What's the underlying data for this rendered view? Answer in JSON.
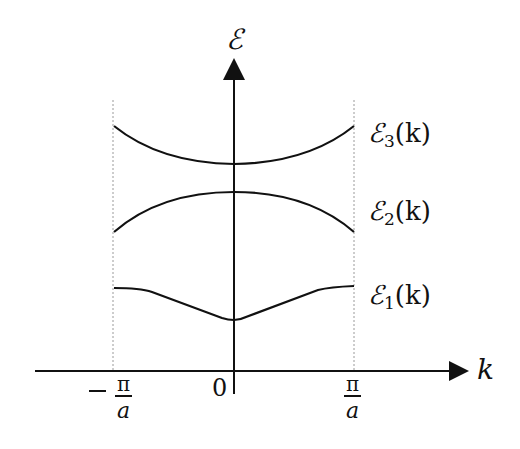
{
  "figure": {
    "type": "band-structure-diagram",
    "y_axis_label": "ℰ",
    "x_axis_label": "k",
    "x_ticks": [
      {
        "position": "left-zone-boundary",
        "sign": "−",
        "numerator": "π",
        "denominator": "a"
      },
      {
        "position": "origin",
        "label": "0"
      },
      {
        "position": "right-zone-boundary",
        "sign": "",
        "numerator": "π",
        "denominator": "a"
      }
    ],
    "bands": [
      {
        "id": "band-1",
        "symbol": "ℰ",
        "index": "1",
        "argument": "(k)",
        "label": "ℰ1(k)",
        "shape": "V-shaped minimum at k=0, flattening at zone edges"
      },
      {
        "id": "band-2",
        "symbol": "ℰ",
        "index": "2",
        "argument": "(k)",
        "label": "ℰ2(k)",
        "shape": "maximum at k=0, curving down at zone edges"
      },
      {
        "id": "band-3",
        "symbol": "ℰ",
        "index": "3",
        "argument": "(k)",
        "label": "ℰ3(k)",
        "shape": "minimum at k=0, curving up at zone edges"
      }
    ],
    "zone_boundaries": "dashed vertical lines at k = ±π/a",
    "colors": {
      "line": "#111111",
      "dashed": "#9a9a9a",
      "background": "#ffffff"
    }
  }
}
